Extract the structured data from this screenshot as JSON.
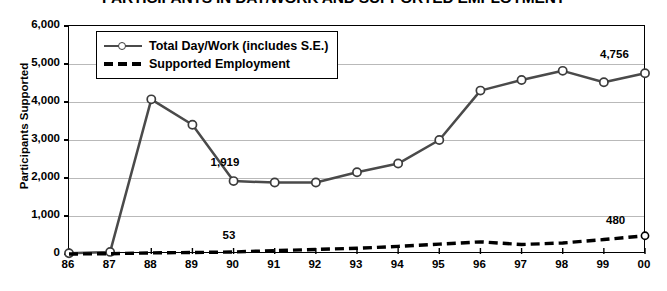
{
  "chart_data": {
    "type": "line",
    "title": "PARTICIPANTS IN DAY/WORK AND SUPPORTED EMPLOYMENT",
    "xlabel": "Fiscal Year",
    "ylabel": "Participants Supported",
    "categories": [
      "86",
      "87",
      "88",
      "89",
      "90",
      "91",
      "92",
      "93",
      "94",
      "95",
      "96",
      "97",
      "98",
      "99",
      "00"
    ],
    "ylim": [
      0,
      6000
    ],
    "yticks": [
      0,
      1000,
      2000,
      3000,
      4000,
      5000,
      6000
    ],
    "ytick_labels": [
      "0",
      "1,000",
      "2,000",
      "3,000",
      "4,000",
      "5,000",
      "6,000"
    ],
    "grid": true,
    "legend_position": "upper-left-inside",
    "series": [
      {
        "name": "Total Day/Work (includes S.E.)",
        "style": "solid-with-circle-markers",
        "color": "#4a4a4a",
        "values": [
          20,
          55,
          4070,
          3400,
          1919,
          1880,
          1880,
          2150,
          2380,
          3000,
          4300,
          4580,
          4820,
          4520,
          4756
        ]
      },
      {
        "name": "Supported Employment",
        "style": "dashed",
        "color": "#000000",
        "values": [
          0,
          8,
          30,
          40,
          53,
          90,
          120,
          150,
          200,
          260,
          320,
          250,
          290,
          380,
          480
        ]
      }
    ],
    "annotations": [
      {
        "text": "1,919",
        "series": "Total Day/Work (includes S.E.)",
        "category": "90",
        "value": 1919
      },
      {
        "text": "53",
        "series": "Supported Employment",
        "category": "90",
        "value": 53
      },
      {
        "text": "4,756",
        "series": "Total Day/Work (includes S.E.)",
        "category": "00",
        "value": 4756
      },
      {
        "text": "480",
        "series": "Supported Employment",
        "category": "00",
        "value": 480
      }
    ]
  },
  "legend": {
    "items": [
      {
        "label": "Total Day/Work (includes S.E.)"
      },
      {
        "label": "Supported Employment"
      }
    ]
  }
}
